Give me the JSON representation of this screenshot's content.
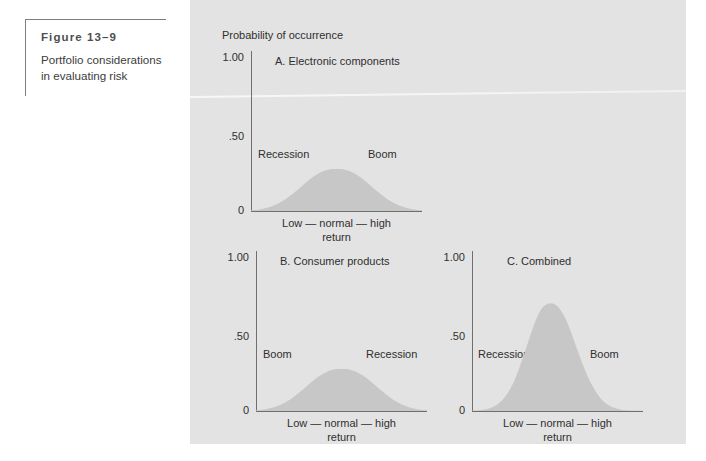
{
  "figure": {
    "number_label": "Figure 13–9",
    "caption_line1": "Portfolio considerations",
    "caption_line2": "in evaluating risk"
  },
  "panel": {
    "background_color": "#e3e3e3",
    "curve_fill_color": "#c6c7c6",
    "axis_color": "#6f6f6f",
    "text_color": "#2f2f2f",
    "y_axis_caption": "Probability of occurrence"
  },
  "chart_data": [
    {
      "id": "A",
      "type": "area",
      "title": "A. Electronic components",
      "ylabel": "Probability of occurrence",
      "xlabel_line1": "Low — normal — high",
      "xlabel_line2": "return",
      "yticks": [
        "1.00",
        ".50",
        "0"
      ],
      "ytick_values": [
        1.0,
        0.5,
        0
      ],
      "ylim": [
        0,
        1.0
      ],
      "grid": false,
      "legend": "none",
      "annotations": [
        {
          "text": "Recession",
          "side": "left"
        },
        {
          "text": "Boom",
          "side": "right"
        }
      ],
      "distribution": {
        "mean": 0.5,
        "sigma": 0.16,
        "peak": 0.26
      },
      "x": [
        0.0,
        0.05,
        0.1,
        0.15,
        0.2,
        0.25,
        0.3,
        0.35,
        0.4,
        0.45,
        0.5,
        0.55,
        0.6,
        0.65,
        0.7,
        0.75,
        0.8,
        0.85,
        0.9,
        0.95,
        1.0
      ],
      "values": [
        0.004,
        0.01,
        0.022,
        0.042,
        0.072,
        0.112,
        0.158,
        0.203,
        0.238,
        0.258,
        0.262,
        0.258,
        0.238,
        0.203,
        0.158,
        0.112,
        0.072,
        0.042,
        0.022,
        0.01,
        0.004
      ]
    },
    {
      "id": "B",
      "type": "area",
      "title": "B. Consumer products",
      "xlabel_line1": "Low — normal — high",
      "xlabel_line2": "return",
      "yticks": [
        "1.00",
        ".50",
        "0"
      ],
      "ytick_values": [
        1.0,
        0.5,
        0
      ],
      "ylim": [
        0,
        1.0
      ],
      "grid": false,
      "legend": "none",
      "annotations": [
        {
          "text": "Boom",
          "side": "left"
        },
        {
          "text": "Recession",
          "side": "right"
        }
      ],
      "distribution": {
        "mean": 0.5,
        "sigma": 0.16,
        "peak": 0.26
      },
      "x": [
        0.0,
        0.05,
        0.1,
        0.15,
        0.2,
        0.25,
        0.3,
        0.35,
        0.4,
        0.45,
        0.5,
        0.55,
        0.6,
        0.65,
        0.7,
        0.75,
        0.8,
        0.85,
        0.9,
        0.95,
        1.0
      ],
      "values": [
        0.004,
        0.01,
        0.022,
        0.042,
        0.072,
        0.112,
        0.158,
        0.203,
        0.238,
        0.258,
        0.262,
        0.258,
        0.238,
        0.203,
        0.158,
        0.112,
        0.072,
        0.042,
        0.022,
        0.01,
        0.004
      ]
    },
    {
      "id": "C",
      "type": "area",
      "title": "C. Combined",
      "xlabel_line1": "Low — normal — high",
      "xlabel_line2": "return",
      "yticks": [
        "1.00",
        ".50",
        "0"
      ],
      "ytick_values": [
        1.0,
        0.5,
        0
      ],
      "ylim": [
        0,
        1.0
      ],
      "grid": false,
      "legend": "none",
      "annotations": [
        {
          "text": "Recession",
          "side": "left"
        },
        {
          "text": "Boom",
          "side": "right"
        }
      ],
      "distribution": {
        "mean": 0.47,
        "sigma": 0.095,
        "peak": 0.67
      },
      "x": [
        0.0,
        0.05,
        0.1,
        0.15,
        0.2,
        0.25,
        0.3,
        0.35,
        0.4,
        0.45,
        0.5,
        0.55,
        0.6,
        0.65,
        0.7,
        0.75,
        0.8,
        0.85,
        0.9,
        0.95,
        1.0
      ],
      "values": [
        0.002,
        0.006,
        0.016,
        0.042,
        0.098,
        0.196,
        0.34,
        0.5,
        0.628,
        0.672,
        0.655,
        0.57,
        0.43,
        0.285,
        0.165,
        0.082,
        0.036,
        0.014,
        0.005,
        0.002,
        0.001
      ]
    }
  ]
}
